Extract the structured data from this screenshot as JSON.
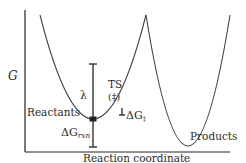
{
  "diagram": {
    "y_axis_label": "G",
    "x_axis_label": "Reaction coordinate",
    "labels": {
      "reactants": "Reactants",
      "products": "Products",
      "ts": "TS",
      "ts_symbol": "(‡)",
      "lambda": "λ",
      "dg_rxn_main": "ΔG",
      "dg_rxn_sub": "rxn",
      "dg_act_main": "ΔG",
      "dg_act_sub": "‡"
    },
    "curves": [
      {
        "name": "reactant-parabola",
        "vertex": [
          93,
          119
        ],
        "color": "#444444"
      },
      {
        "name": "product-parabola",
        "vertex": [
          188,
          146
        ],
        "color": "#444444"
      }
    ],
    "colors": {
      "axis": "#222222",
      "curve": "#444444",
      "text": "#2a2a2a",
      "background": "#ffffff"
    }
  }
}
